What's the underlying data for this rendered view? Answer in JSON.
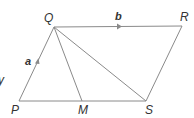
{
  "diagram": {
    "type": "geometry",
    "shape": "parallelogram",
    "points": {
      "P": {
        "label": "P",
        "x": 19,
        "y": 101
      },
      "Q": {
        "label": "Q",
        "x": 54,
        "y": 27
      },
      "R": {
        "label": "R",
        "x": 182,
        "y": 26
      },
      "S": {
        "label": "S",
        "x": 146,
        "y": 101
      },
      "M": {
        "label": "M",
        "x": 82,
        "y": 101
      }
    },
    "vectors": {
      "PQ": {
        "label": "a"
      },
      "QR": {
        "label": "b"
      }
    },
    "segments": [
      "PQ",
      "QR",
      "RS",
      "SP",
      "QM",
      "QS"
    ],
    "partial_text": "y",
    "line_color": "#8a8a8a",
    "text_color": "#333333"
  }
}
